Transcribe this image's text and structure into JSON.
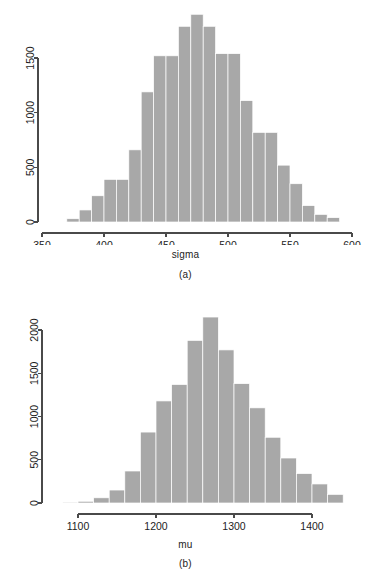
{
  "figure": {
    "background_color": "#ffffff",
    "bar_color": "#a8a8a8",
    "axis_color": "#4a4a4a"
  },
  "panels": [
    {
      "id": "a",
      "caption": "(a)",
      "xlabel": "sigma"
    },
    {
      "id": "b",
      "caption": "(b)",
      "xlabel": "mu"
    }
  ],
  "chart_data": [
    {
      "type": "bar",
      "id": "a",
      "title": "",
      "xlabel": "sigma",
      "ylabel": "",
      "caption": "(a)",
      "grid": false,
      "legend": null,
      "xlim": [
        350,
        600
      ],
      "ylim": [
        0,
        1900
      ],
      "xticks": [
        350,
        400,
        450,
        500,
        550,
        600
      ],
      "yticks": [
        0,
        500,
        1000,
        1500
      ],
      "bin_width": 10,
      "bin_edges": [
        370,
        380,
        390,
        400,
        410,
        420,
        430,
        440,
        450,
        460,
        470,
        480,
        490,
        500,
        510,
        520,
        530,
        540,
        550,
        560,
        570,
        580,
        590
      ],
      "categories": [
        "370-380",
        "380-390",
        "390-400",
        "400-410",
        "410-420",
        "420-430",
        "430-440",
        "440-450",
        "450-460",
        "460-470",
        "470-480",
        "480-490",
        "490-500",
        "500-510",
        "510-520",
        "520-530",
        "530-540",
        "540-550",
        "550-560",
        "560-570",
        "570-580",
        "580-590"
      ],
      "values": [
        30,
        110,
        240,
        390,
        390,
        660,
        1190,
        1520,
        1520,
        1790,
        1900,
        1790,
        1540,
        1540,
        1110,
        820,
        820,
        520,
        350,
        150,
        70,
        40
      ]
    },
    {
      "type": "bar",
      "id": "b",
      "title": "",
      "xlabel": "mu",
      "ylabel": "",
      "caption": "(b)",
      "grid": false,
      "legend": null,
      "xlim": [
        1080,
        1430
      ],
      "ylim": [
        0,
        2150
      ],
      "xticks": [
        1100,
        1200,
        1300,
        1400
      ],
      "yticks": [
        0,
        500,
        1000,
        1500,
        2000
      ],
      "bin_width": 20,
      "bin_edges": [
        1080,
        1100,
        1120,
        1140,
        1160,
        1180,
        1200,
        1220,
        1240,
        1260,
        1280,
        1300,
        1320,
        1340,
        1360,
        1380,
        1400,
        1420
      ],
      "categories": [
        "1080-1100",
        "1100-1120",
        "1120-1140",
        "1140-1160",
        "1160-1180",
        "1180-1200",
        "1200-1220",
        "1220-1240",
        "1240-1260",
        "1260-1280",
        "1280-1300",
        "1300-1320",
        "1320-1340",
        "1340-1360",
        "1360-1380",
        "1380-1400",
        "1400-1420"
      ],
      "values": [
        10,
        20,
        60,
        150,
        370,
        820,
        1180,
        1370,
        1880,
        2150,
        1770,
        1380,
        1100,
        760,
        520,
        340,
        220,
        100
      ]
    }
  ]
}
